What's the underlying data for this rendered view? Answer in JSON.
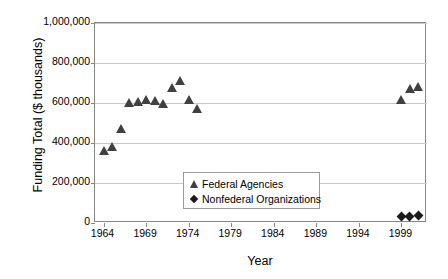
{
  "chart_data": {
    "type": "scatter",
    "title": "",
    "xlabel": "Year",
    "ylabel": "Funding Total ($ thousands)",
    "xlim": [
      1963,
      2002
    ],
    "ylim": [
      0,
      1000000
    ],
    "xticks": [
      "1964",
      "1969",
      "1974",
      "1979",
      "1984",
      "1989",
      "1994",
      "1999"
    ],
    "xtick_values": [
      1964,
      1969,
      1974,
      1979,
      1984,
      1989,
      1994,
      1999
    ],
    "yticks": [
      "0",
      "200,000",
      "400,000",
      "600,000",
      "800,000",
      "1,000,000"
    ],
    "ytick_values": [
      0,
      200000,
      400000,
      600000,
      800000,
      1000000
    ],
    "grid": true,
    "legend_position": "center",
    "series": [
      {
        "name": "Federal Agencies",
        "marker": "triangle",
        "color": "#404040",
        "points": [
          {
            "x": 1964,
            "y": 360000
          },
          {
            "x": 1965,
            "y": 380000
          },
          {
            "x": 1966,
            "y": 470000
          },
          {
            "x": 1967,
            "y": 600000
          },
          {
            "x": 1968,
            "y": 605000
          },
          {
            "x": 1969,
            "y": 615000
          },
          {
            "x": 1970,
            "y": 610000
          },
          {
            "x": 1971,
            "y": 595000
          },
          {
            "x": 1972,
            "y": 675000
          },
          {
            "x": 1973,
            "y": 710000
          },
          {
            "x": 1974,
            "y": 615000
          },
          {
            "x": 1975,
            "y": 570000
          },
          {
            "x": 1999,
            "y": 615000
          },
          {
            "x": 2000,
            "y": 670000
          },
          {
            "x": 2001,
            "y": 680000
          }
        ]
      },
      {
        "name": "Nonfederal Organizations",
        "marker": "diamond",
        "color": "#1a1a1a",
        "points": [
          {
            "x": 1999,
            "y": 35000
          },
          {
            "x": 2000,
            "y": 35000
          },
          {
            "x": 2001,
            "y": 40000
          }
        ]
      }
    ]
  },
  "legend": {
    "entries": [
      {
        "label": "Federal Agencies",
        "marker": "triangle"
      },
      {
        "label": "Nonfederal Organizations",
        "marker": "diamond"
      }
    ]
  }
}
